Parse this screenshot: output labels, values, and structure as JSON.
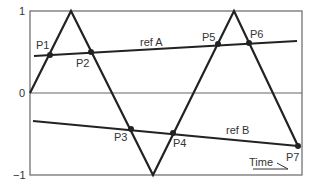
{
  "diagram": {
    "type": "triangle-wave-comparison",
    "y_axis": {
      "ticks": [
        {
          "label": "1",
          "value": 1
        },
        {
          "label": "0",
          "value": 0
        },
        {
          "label": "−1",
          "value": -1
        }
      ]
    },
    "x_axis": {
      "label": "Time"
    },
    "carrier": {
      "name": "triangle-carrier",
      "vertices": [
        [
          0,
          0
        ],
        [
          0.15,
          1
        ],
        [
          0.45,
          -1
        ],
        [
          0.75,
          1
        ],
        [
          0.985,
          -0.33
        ]
      ]
    },
    "references": [
      {
        "name": "ref A",
        "label": "ref A"
      },
      {
        "name": "ref B",
        "label": "ref B"
      }
    ],
    "intersection_points": [
      {
        "label": "P1"
      },
      {
        "label": "P2"
      },
      {
        "label": "P3"
      },
      {
        "label": "P4"
      },
      {
        "label": "P5"
      },
      {
        "label": "P6"
      },
      {
        "label": "P7"
      }
    ],
    "colors": {
      "line": "#222222",
      "frame": "#555555",
      "text": "#333333"
    }
  }
}
